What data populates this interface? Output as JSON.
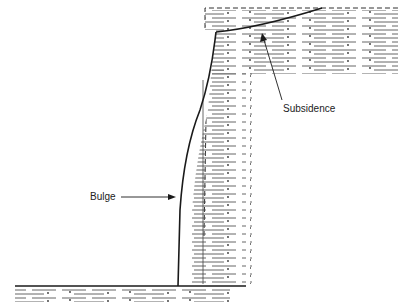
{
  "diagram": {
    "type": "geological cross-section",
    "labels": {
      "bulge": "Bulge",
      "subsidence": "Subsidence"
    },
    "colors": {
      "line": "#1a1a1a",
      "strata": "#555555",
      "background": "#ffffff"
    }
  }
}
